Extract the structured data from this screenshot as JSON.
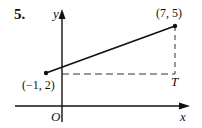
{
  "problem": {
    "number_label": "5."
  },
  "axes": {
    "x_label": "x",
    "y_label": "y",
    "origin_label": "O"
  },
  "points": [
    {
      "label": "(−1, 2)",
      "x": -1,
      "y": 2
    },
    {
      "label": "(7, 5)",
      "x": 7,
      "y": 5
    }
  ],
  "corner_point": {
    "label": "T"
  },
  "colors": {
    "ink": "#111111",
    "dashed": "#333333",
    "background": "#ffffff"
  }
}
